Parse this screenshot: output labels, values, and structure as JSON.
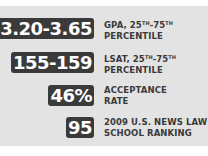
{
  "stats": [
    {
      "value": "3.20-3.65",
      "label_line1": "GPA, 25",
      "sup1": "TH",
      "mid": "-75",
      "sup2": "TH",
      "label_line2": "PERCENTILE"
    },
    {
      "value": "155-159",
      "label_line1": "LSAT, 25",
      "sup1": "TH",
      "mid": "-75",
      "sup2": "TH",
      "label_line2": "PERCENTILE"
    },
    {
      "value": "46%",
      "label_line1": "ACCEPTANCE",
      "label_line2": "RATE"
    },
    {
      "value": "95",
      "label_line1": "2009 U.S. NEWS LAW",
      "label_line2": "SCHOOL RANKING"
    }
  ],
  "colors": {
    "badge_bg": "#3a3a3a",
    "panel_bg": "#e3e3e3",
    "text": "#3a3a3a"
  }
}
